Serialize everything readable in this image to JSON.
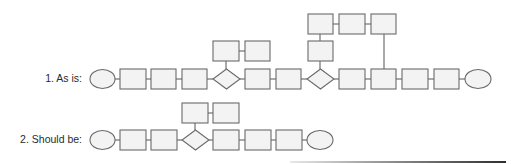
{
  "diagram": {
    "type": "process-flow-comparison",
    "rows": [
      {
        "id": "as-is",
        "label": "1. As is:",
        "main_flow": [
          "start-ellipse",
          "step",
          "step",
          "step",
          "decision",
          "step",
          "step",
          "decision",
          "step",
          "step",
          "step",
          "step",
          "end-ellipse"
        ],
        "branches": [
          {
            "from": "decision-1",
            "boxes": 2,
            "layout": "horizontal-above"
          },
          {
            "from": "decision-2",
            "boxes": 4,
            "layout": "loop-above",
            "rejoins_at": "step-9"
          }
        ]
      },
      {
        "id": "should-be",
        "label": "2. Should be:",
        "main_flow": [
          "start-ellipse",
          "step",
          "step",
          "decision",
          "step",
          "step",
          "step",
          "end-ellipse"
        ],
        "branches": [
          {
            "from": "decision-1",
            "boxes": 2,
            "layout": "horizontal-above"
          }
        ]
      }
    ],
    "colors": {
      "shape_fill": "#f3f3f3",
      "shape_stroke": "#6a6a6a",
      "connector": "#555555",
      "text": "#2a2a2a"
    }
  }
}
